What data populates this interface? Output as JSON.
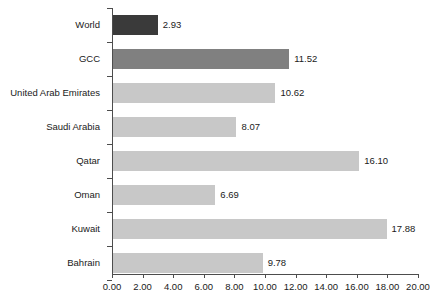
{
  "chart_data": {
    "type": "bar",
    "orientation": "horizontal",
    "title": "",
    "subtitle": "",
    "xlabel": "",
    "ylabel": "",
    "xlim": [
      0,
      20
    ],
    "xtick_step": 2,
    "grid": false,
    "legend": "none",
    "categories": [
      "World",
      "GCC",
      "United Arab Emirates",
      "Saudi Arabia",
      "Qatar",
      "Oman",
      "Kuwait",
      "Bahrain"
    ],
    "values": [
      2.93,
      11.52,
      10.62,
      8.07,
      16.1,
      6.69,
      17.88,
      9.78
    ],
    "value_labels": [
      "2.93",
      "11.52",
      "10.62",
      "8.07",
      "16.10",
      "6.69",
      "17.88",
      "9.78"
    ],
    "bar_styles": [
      "dark",
      "medium",
      "light",
      "light",
      "light",
      "light",
      "light",
      "light"
    ],
    "xtick_labels": [
      "0.00",
      "2.00",
      "4.00",
      "6.00",
      "8.00",
      "10.00",
      "12.00",
      "14.00",
      "16.00",
      "18.00",
      "20.00"
    ],
    "xtick_values": [
      0,
      2,
      4,
      6,
      8,
      10,
      12,
      14,
      16,
      18,
      20
    ],
    "colors": {
      "bar_dark": "#3a3a3a",
      "bar_medium": "#808080",
      "bar_light": "#c8c8c8",
      "axis": "#4d4d4d",
      "text": "#1a1a1a",
      "background": "#ffffff"
    }
  }
}
